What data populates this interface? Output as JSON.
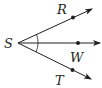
{
  "diagram": {
    "type": "angle-rays",
    "vertex": {
      "label": "S"
    },
    "rays": [
      {
        "label": "R",
        "direction": "upper-right"
      },
      {
        "label": "W",
        "direction": "right"
      },
      {
        "label": "T",
        "direction": "lower-right"
      }
    ],
    "angle_marks": "single arcs marking angle RSW and angle WST as congruent",
    "stroke_color": "#231f20"
  }
}
